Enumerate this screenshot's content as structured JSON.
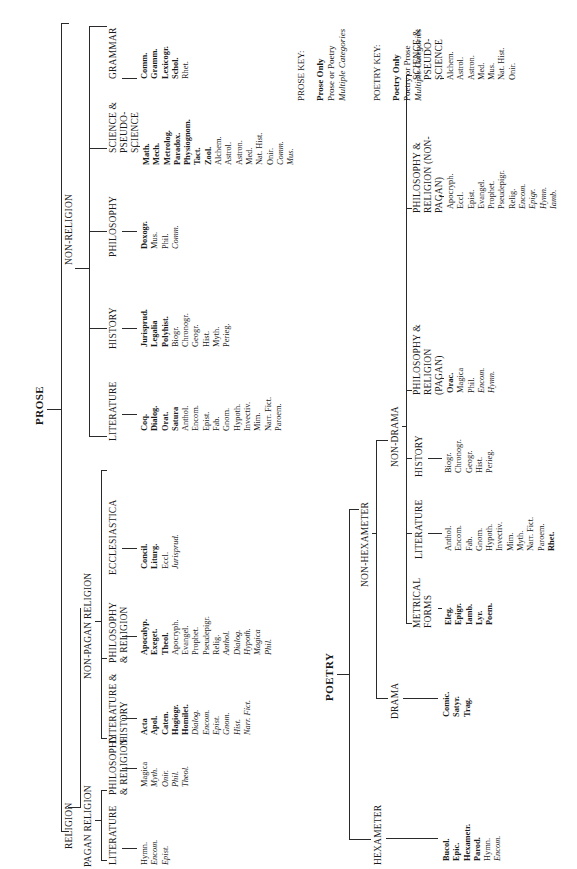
{
  "prose": {
    "title": "PROSE",
    "religion": {
      "label": "RELIGION",
      "pagan": {
        "label": "PAGAN RELIGION",
        "groups": [
          {
            "label": "LITERATURE",
            "items": [
              {
                "t": "Hymn.",
                "s": "r"
              },
              {
                "t": "Encom.",
                "s": "i"
              },
              {
                "t": "Epist.",
                "s": "i"
              }
            ]
          },
          {
            "label": "PHILOSOPHY & RELIGION",
            "items": [
              {
                "t": "Magica",
                "s": "r"
              },
              {
                "t": "Myth.",
                "s": "i"
              },
              {
                "t": "Onir.",
                "s": "i"
              },
              {
                "t": "Phil.",
                "s": "i"
              },
              {
                "t": "Theol.",
                "s": "i"
              }
            ]
          }
        ]
      },
      "non_pagan": {
        "label": "NON-PAGAN RELIGION",
        "groups": [
          {
            "label": "LITERATURE & HISTORY",
            "items": [
              {
                "t": "Acta",
                "s": "b"
              },
              {
                "t": "Apol.",
                "s": "b"
              },
              {
                "t": "Caten.",
                "s": "b"
              },
              {
                "t": "Hagiogr.",
                "s": "b"
              },
              {
                "t": "Homilet.",
                "s": "b"
              },
              {
                "t": "Dialog.",
                "s": "i"
              },
              {
                "t": "Encom.",
                "s": "i"
              },
              {
                "t": "Epist.",
                "s": "i"
              },
              {
                "t": "Gnom.",
                "s": "i"
              },
              {
                "t": "Hist.",
                "s": "i"
              },
              {
                "t": "Narr. Fict.",
                "s": "i"
              }
            ]
          },
          {
            "label": "PHILOSOPHY & RELIGION",
            "items": [
              {
                "t": "Apocalyp.",
                "s": "b"
              },
              {
                "t": "Exeget.",
                "s": "b"
              },
              {
                "t": "Theol.",
                "s": "b"
              },
              {
                "t": "Apocryph.",
                "s": "r"
              },
              {
                "t": "Evangel.",
                "s": "r"
              },
              {
                "t": "Prophet.",
                "s": "r"
              },
              {
                "t": "Pseudepigr.",
                "s": "r"
              },
              {
                "t": "Relig.",
                "s": "r"
              },
              {
                "t": "Anthol.",
                "s": "i"
              },
              {
                "t": "Dialog.",
                "s": "i"
              },
              {
                "t": "Hypoth.",
                "s": "i"
              },
              {
                "t": "Magica",
                "s": "i"
              },
              {
                "t": "Phil.",
                "s": "i"
              }
            ]
          },
          {
            "label": "ECCLESIASTICA",
            "items": [
              {
                "t": "Concil.",
                "s": "b"
              },
              {
                "t": "Liturg.",
                "s": "b"
              },
              {
                "t": "Eccl.",
                "s": "r"
              },
              {
                "t": "Jurisprud.",
                "s": "i"
              }
            ]
          }
        ]
      }
    },
    "non_religion": {
      "label": "NON-RELIGION",
      "groups": [
        {
          "label": "LITERATURE",
          "items": [
            {
              "t": "Coq.",
              "s": "b"
            },
            {
              "t": "Dialog.",
              "s": "b"
            },
            {
              "t": "Orat.",
              "s": "b"
            },
            {
              "t": "Satura",
              "s": "b"
            },
            {
              "t": "Anthol.",
              "s": "r"
            },
            {
              "t": "Encom.",
              "s": "r"
            },
            {
              "t": "Epist.",
              "s": "r"
            },
            {
              "t": "Fab.",
              "s": "r"
            },
            {
              "t": "Gnom.",
              "s": "r"
            },
            {
              "t": "Hypoth.",
              "s": "r"
            },
            {
              "t": "Invectiv.",
              "s": "r"
            },
            {
              "t": "Mim.",
              "s": "r"
            },
            {
              "t": "Narr. Fict.",
              "s": "r"
            },
            {
              "t": "Paroem.",
              "s": "r"
            }
          ]
        },
        {
          "label": "HISTORY",
          "items": [
            {
              "t": "Jurisprud.",
              "s": "b"
            },
            {
              "t": "Legalia",
              "s": "b"
            },
            {
              "t": "Polyhist.",
              "s": "b"
            },
            {
              "t": "Biogr.",
              "s": "r"
            },
            {
              "t": "Chronogr.",
              "s": "r"
            },
            {
              "t": "Geogr.",
              "s": "r"
            },
            {
              "t": "Hist.",
              "s": "r"
            },
            {
              "t": "Myth.",
              "s": "r"
            },
            {
              "t": "Perieg.",
              "s": "r"
            }
          ]
        },
        {
          "label": "PHILOSOPHY",
          "items": [
            {
              "t": "Doxogr.",
              "s": "b"
            },
            {
              "t": "Mus.",
              "s": "r"
            },
            {
              "t": "Phil.",
              "s": "r"
            },
            {
              "t": "Comm.",
              "s": "i"
            }
          ]
        },
        {
          "label": "SCIENCE & PSEUDO-SCIENCE",
          "items": [
            {
              "t": "Math.",
              "s": "b"
            },
            {
              "t": "Mech.",
              "s": "b"
            },
            {
              "t": "Metrolog.",
              "s": "b"
            },
            {
              "t": "Paradox.",
              "s": "b"
            },
            {
              "t": "Physiognom.",
              "s": "b"
            },
            {
              "t": "Tact.",
              "s": "b"
            },
            {
              "t": "Zool.",
              "s": "b"
            },
            {
              "t": "Alchem.",
              "s": "r"
            },
            {
              "t": "Astrol.",
              "s": "r"
            },
            {
              "t": "Astron.",
              "s": "r"
            },
            {
              "t": "Med.",
              "s": "r"
            },
            {
              "t": "Nat. Hist.",
              "s": "r"
            },
            {
              "t": "Onir.",
              "s": "r"
            },
            {
              "t": "Comm.",
              "s": "i"
            },
            {
              "t": "Mus.",
              "s": "i"
            }
          ]
        },
        {
          "label": "GRAMMAR",
          "items": [
            {
              "t": "Comm.",
              "s": "b"
            },
            {
              "t": "Gramm.",
              "s": "b"
            },
            {
              "t": "Lexicogr.",
              "s": "b"
            },
            {
              "t": "Schol.",
              "s": "b"
            },
            {
              "t": "Rhet.",
              "s": "r"
            }
          ]
        }
      ]
    }
  },
  "poetry": {
    "title": "POETRY",
    "hexameter": {
      "label": "HEXAMETER",
      "items": [
        {
          "t": "Bucol.",
          "s": "b"
        },
        {
          "t": "Epic.",
          "s": "b"
        },
        {
          "t": "Hexametr.",
          "s": "b"
        },
        {
          "t": "Parod.",
          "s": "b"
        },
        {
          "t": "Hymn.",
          "s": "r"
        },
        {
          "t": "Encom.",
          "s": "i"
        }
      ]
    },
    "non_hexameter": {
      "label": "NON-HEXAMETER",
      "drama": {
        "label": "DRAMA",
        "items": [
          {
            "t": "Comic.",
            "s": "b"
          },
          {
            "t": "Satyr.",
            "s": "b"
          },
          {
            "t": "Trag.",
            "s": "b"
          }
        ]
      },
      "non_drama": {
        "label": "NON-DRAMA",
        "groups": [
          {
            "label": "METRICAL FORMS",
            "items": [
              {
                "t": "Eleg.",
                "s": "b"
              },
              {
                "t": "Epigr.",
                "s": "b"
              },
              {
                "t": "Iamb.",
                "s": "b"
              },
              {
                "t": "Lyr.",
                "s": "b"
              },
              {
                "t": "Poem.",
                "s": "b"
              }
            ]
          },
          {
            "label": "LITERATURE",
            "items": [
              {
                "t": "Anthol.",
                "s": "r"
              },
              {
                "t": "Encom.",
                "s": "r"
              },
              {
                "t": "Fab.",
                "s": "r"
              },
              {
                "t": "Gnom.",
                "s": "r"
              },
              {
                "t": "Hypoth.",
                "s": "r"
              },
              {
                "t": "Invectiv.",
                "s": "r"
              },
              {
                "t": "Mim.",
                "s": "r"
              },
              {
                "t": "Myth.",
                "s": "r"
              },
              {
                "t": "Narr. Fict.",
                "s": "r"
              },
              {
                "t": "Paroem.",
                "s": "r"
              },
              {
                "t": "Rhet.",
                "s": "b"
              }
            ]
          },
          {
            "label": "HISTORY",
            "items": [
              {
                "t": "Biogr.",
                "s": "r"
              },
              {
                "t": "Chronogr.",
                "s": "r"
              },
              {
                "t": "Geogr.",
                "s": "r"
              },
              {
                "t": "Hist.",
                "s": "r"
              },
              {
                "t": "Perieg.",
                "s": "r"
              }
            ]
          },
          {
            "label": "PHILOSOPHY & RELIGION (PAGAN)",
            "items": [
              {
                "t": "Orac.",
                "s": "b"
              },
              {
                "t": "Magica",
                "s": "r"
              },
              {
                "t": "Phil.",
                "s": "r"
              },
              {
                "t": "Encom.",
                "s": "i"
              },
              {
                "t": "Hymn.",
                "s": "i"
              }
            ]
          },
          {
            "label": "PHILOSOPHY & RELIGION (NON-PAGAN)",
            "items": [
              {
                "t": "Apocryph.",
                "s": "r"
              },
              {
                "t": "Eccl.",
                "s": "r"
              },
              {
                "t": "Epist.",
                "s": "r"
              },
              {
                "t": "Evangel.",
                "s": "r"
              },
              {
                "t": "Prophet.",
                "s": "r"
              },
              {
                "t": "Pseudepigr.",
                "s": "r"
              },
              {
                "t": "Relig.",
                "s": "r"
              },
              {
                "t": "Encom.",
                "s": "i"
              },
              {
                "t": "Epigr.",
                "s": "i"
              },
              {
                "t": "Hymn.",
                "s": "i"
              },
              {
                "t": "Iamb.",
                "s": "i"
              }
            ]
          },
          {
            "label": "SCIENCE & PSEUDO-SCIENCE",
            "items": [
              {
                "t": "Alchem.",
                "s": "r"
              },
              {
                "t": "Astrol.",
                "s": "r"
              },
              {
                "t": "Astron.",
                "s": "r"
              },
              {
                "t": "Med.",
                "s": "r"
              },
              {
                "t": "Mus.",
                "s": "r"
              },
              {
                "t": "Nat. Hist.",
                "s": "r"
              },
              {
                "t": "Onir.",
                "s": "r"
              }
            ]
          }
        ]
      }
    }
  },
  "keys": {
    "prose": {
      "title": "PROSE KEY:",
      "entries": [
        {
          "t": "Prose Only",
          "s": "b"
        },
        {
          "t": "Prose or Poetry",
          "s": "r"
        },
        {
          "t": "Multiple Categories",
          "s": "i"
        }
      ]
    },
    "poetry": {
      "title": "POETRY KEY:",
      "entries": [
        {
          "t": "Poetry Only",
          "s": "b"
        },
        {
          "t": "Poetry or Prose",
          "s": "r"
        },
        {
          "t": "Multiple Categories",
          "s": "i"
        }
      ]
    }
  }
}
